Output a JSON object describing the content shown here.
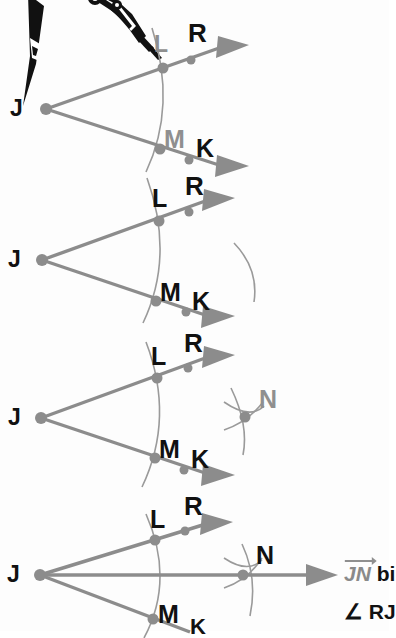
{
  "figure": {
    "steps": 4,
    "colors": {
      "ray": "#8c8c8c",
      "arc": "#9a9a9a",
      "point": "#8c8c8c",
      "label_black": "#111111",
      "label_gray": "#8f8f8f",
      "compass_black": "#111111",
      "background": "#fdfdfd"
    }
  },
  "panels": [
    {
      "id": "panel-1",
      "name": "step-draw-arc-through-rays",
      "tool": "compass",
      "vertex_label": "J",
      "labels": [
        {
          "text": "L",
          "color": "gray"
        },
        {
          "text": "R",
          "color": "black"
        },
        {
          "text": "M",
          "color": "gray"
        },
        {
          "text": "K",
          "color": "black"
        }
      ]
    },
    {
      "id": "panel-2",
      "name": "step-arc-from-L",
      "vertex_label": "J",
      "labels": [
        {
          "text": "L",
          "color": "black"
        },
        {
          "text": "R",
          "color": "black"
        },
        {
          "text": "M",
          "color": "black"
        },
        {
          "text": "K",
          "color": "black"
        }
      ]
    },
    {
      "id": "panel-3",
      "name": "step-arcs-intersect-at-N",
      "vertex_label": "J",
      "labels": [
        {
          "text": "L",
          "color": "black"
        },
        {
          "text": "R",
          "color": "black"
        },
        {
          "text": "M",
          "color": "black"
        },
        {
          "text": "K",
          "color": "black"
        },
        {
          "text": "N",
          "color": "gray"
        }
      ]
    },
    {
      "id": "panel-4",
      "name": "step-draw-bisector-ray-JN",
      "vertex_label": "J",
      "labels": [
        {
          "text": "L",
          "color": "black"
        },
        {
          "text": "R",
          "color": "black"
        },
        {
          "text": "M",
          "color": "black"
        },
        {
          "text": "K",
          "color": "black"
        },
        {
          "text": "N",
          "color": "black"
        }
      ]
    }
  ],
  "caption": {
    "vector": "JN",
    "line1_rest": " bi",
    "line2": "∠ RJ"
  }
}
